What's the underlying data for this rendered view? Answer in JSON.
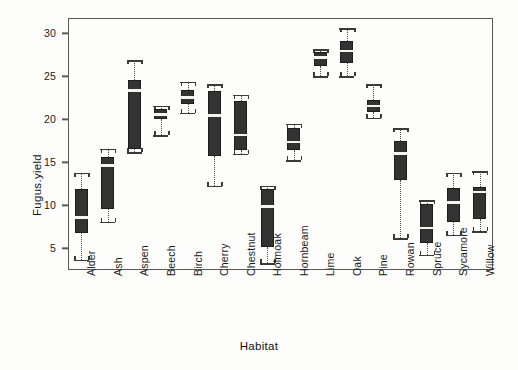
{
  "figure": {
    "background_color": "#fdfdfb",
    "box_fill_color": "#333333",
    "median_color": "#f4f4f2",
    "axis_color": "#5a5a5a"
  },
  "axes": {
    "y_title": "Fugus.yield",
    "x_title": "Habitat",
    "y_ticks": [
      5,
      10,
      15,
      20,
      25,
      30
    ],
    "y_tick_labels": [
      "5",
      "10",
      "15",
      "20",
      "25",
      "30"
    ],
    "ylim": [
      2.5,
      31.8
    ],
    "grid": "off",
    "legend": "none"
  },
  "chart_data": {
    "type": "boxplot",
    "title": "",
    "xlabel": "Habitat",
    "ylabel": "Fugus.yield",
    "ylim": [
      2.5,
      31.8
    ],
    "grid": false,
    "legend_position": "none",
    "categories": [
      "Alder",
      "Ash",
      "Aspen",
      "Beech",
      "Birch",
      "Cherry",
      "Chestnut",
      "Holmoak",
      "Hornbeam",
      "Lime",
      "Oak",
      "Pine",
      "Rowan",
      "Spruce",
      "Sycamore",
      "Willow"
    ],
    "boxes": [
      {
        "category": "Alder",
        "whisker_low": 3.7,
        "q1": 6.8,
        "median": 8.6,
        "q3": 11.9,
        "whisker_high": 13.8
      },
      {
        "category": "Ash",
        "whisker_low": 8.1,
        "q1": 9.6,
        "median": 14.7,
        "q3": 15.6,
        "whisker_high": 16.6
      },
      {
        "category": "Aspen",
        "whisker_low": 16.2,
        "q1": 16.6,
        "median": 23.4,
        "q3": 24.6,
        "whisker_high": 26.9
      },
      {
        "category": "Beech",
        "whisker_low": 18.2,
        "q1": 20.1,
        "median": 20.6,
        "q3": 21.2,
        "whisker_high": 21.6
      },
      {
        "category": "Birch",
        "whisker_low": 20.8,
        "q1": 21.8,
        "median": 22.6,
        "q3": 23.4,
        "whisker_high": 24.4
      },
      {
        "category": "Cherry",
        "whisker_low": 12.3,
        "q1": 15.8,
        "median": 20.5,
        "q3": 23.3,
        "whisker_high": 24.1
      },
      {
        "category": "Chestnut",
        "whisker_low": 16.0,
        "q1": 16.5,
        "median": 18.2,
        "q3": 22.1,
        "whisker_high": 22.9
      },
      {
        "category": "Holmoak",
        "whisker_low": 3.3,
        "q1": 5.2,
        "median": 9.9,
        "q3": 11.9,
        "whisker_high": 12.3
      },
      {
        "category": "Hornbeam",
        "whisker_low": 15.3,
        "q1": 16.4,
        "median": 17.4,
        "q3": 19.0,
        "whisker_high": 19.5
      },
      {
        "category": "Lime",
        "whisker_low": 25.0,
        "q1": 26.2,
        "median": 27.2,
        "q3": 27.9,
        "whisker_high": 28.2
      },
      {
        "category": "Oak",
        "whisker_low": 25.0,
        "q1": 26.6,
        "median": 28.0,
        "q3": 29.1,
        "whisker_high": 30.6
      },
      {
        "category": "Pine",
        "whisker_low": 20.2,
        "q1": 20.9,
        "median": 21.6,
        "q3": 22.3,
        "whisker_high": 24.1
      },
      {
        "category": "Rowan",
        "whisker_low": 6.2,
        "q1": 13.0,
        "median": 16.1,
        "q3": 17.5,
        "whisker_high": 19.0
      },
      {
        "category": "Spruce",
        "whisker_low": 4.3,
        "q1": 5.6,
        "median": 7.4,
        "q3": 10.2,
        "whisker_high": 10.6
      },
      {
        "category": "Sycamore",
        "whisker_low": 6.6,
        "q1": 8.1,
        "median": 10.4,
        "q3": 12.0,
        "whisker_high": 13.8
      },
      {
        "category": "Willow",
        "whisker_low": 7.0,
        "q1": 8.4,
        "median": 11.6,
        "q3": 12.2,
        "whisker_high": 14.0
      }
    ]
  }
}
